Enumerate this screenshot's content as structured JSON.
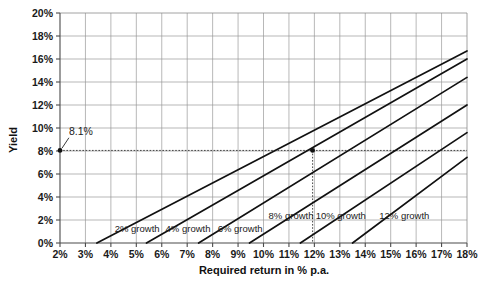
{
  "chart_data": {
    "type": "line",
    "title": "",
    "xlabel": "Required return in % p.a.",
    "ylabel": "Yield",
    "xlim": [
      2,
      18
    ],
    "ylim": [
      0,
      20
    ],
    "grid": true,
    "legend_position": "inline-labels",
    "x_tick_labels": [
      "2%",
      "3%",
      "4%",
      "5%",
      "6%",
      "7%",
      "8%",
      "9%",
      "10%",
      "11%",
      "12%",
      "13%",
      "14%",
      "15%",
      "16%",
      "17%",
      "18%"
    ],
    "x_tick_values": [
      2,
      3,
      4,
      5,
      6,
      7,
      8,
      9,
      10,
      11,
      12,
      13,
      14,
      15,
      16,
      17,
      18
    ],
    "y_tick_labels": [
      "0%",
      "2%",
      "4%",
      "6%",
      "8%",
      "10%",
      "12%",
      "14%",
      "16%",
      "18%",
      "20%"
    ],
    "y_tick_values": [
      0,
      2,
      4,
      6,
      8,
      10,
      12,
      14,
      16,
      18,
      20
    ],
    "series": [
      {
        "name": "2% growth",
        "label": "2% growth",
        "growth": 2,
        "x": [
          3.45,
          18
        ],
        "values": [
          0,
          16.7
        ],
        "label_pos": {
          "x": 4.15,
          "y": 0.95
        }
      },
      {
        "name": "4% growth",
        "label": "4% growth",
        "growth": 4,
        "x": [
          5.4,
          18
        ],
        "values": [
          0,
          16.0
        ],
        "label_pos": {
          "x": 6.15,
          "y": 0.95
        }
      },
      {
        "name": "6% growth",
        "label": "6% growth",
        "growth": 6,
        "x": [
          7.45,
          18
        ],
        "values": [
          0,
          14.4
        ],
        "label_pos": {
          "x": 8.2,
          "y": 0.95
        }
      },
      {
        "name": "8% growth",
        "label": "8% growth",
        "growth": 8,
        "x": [
          9.45,
          18
        ],
        "values": [
          0,
          12.0
        ],
        "label_pos": {
          "x": 10.2,
          "y": 2.05
        }
      },
      {
        "name": "10% growth",
        "label": "10% growth",
        "growth": 10,
        "x": [
          11.45,
          18
        ],
        "values": [
          0,
          9.6
        ],
        "label_pos": {
          "x": 12.05,
          "y": 2.05
        }
      },
      {
        "name": "12% growth",
        "label": "12% growth",
        "growth": 12,
        "x": [
          13.5,
          18
        ],
        "values": [
          0,
          7.45
        ],
        "label_pos": {
          "x": 14.55,
          "y": 2.05
        }
      }
    ],
    "annotations": [
      {
        "name": "yield-annotation",
        "text": "8.1%",
        "value": 8.1,
        "marker": {
          "x": 2.0,
          "y": 8.05
        },
        "text_pos": {
          "x": 2.35,
          "y": 9.35
        },
        "leader_from": {
          "x": 2.35,
          "y": 9.15
        },
        "leader_to": {
          "x": 2.08,
          "y": 8.25
        }
      },
      {
        "name": "intersection-marker",
        "text": "",
        "marker": {
          "x": 11.93,
          "y": 8.05
        }
      }
    ],
    "guides": [
      {
        "name": "horizontal-yield-guide",
        "from": {
          "x": 2,
          "y": 8.05
        },
        "to": {
          "x": 18,
          "y": 8.05
        }
      },
      {
        "name": "vertical-return-guide",
        "from": {
          "x": 11.93,
          "y": 8.05
        },
        "to": {
          "x": 11.93,
          "y": 0
        }
      }
    ]
  }
}
